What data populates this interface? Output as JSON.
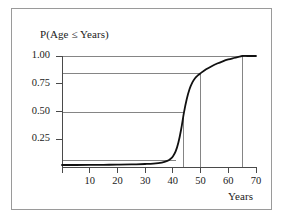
{
  "chart_data": {
    "type": "line",
    "title": "P(Age ≤ Years)",
    "xlabel": "Years",
    "ylabel": "",
    "xlim": [
      0,
      70
    ],
    "ylim": [
      0,
      1.0
    ],
    "grid": false,
    "legend": null,
    "xticks": [
      10,
      20,
      30,
      40,
      50,
      60,
      70
    ],
    "xtick_labels": [
      "10",
      "20",
      "30",
      "40",
      "50",
      "60",
      "70"
    ],
    "yticks": [
      0.25,
      0.5,
      0.75,
      1.0
    ],
    "ytick_labels": [
      "0.25",
      "0.50",
      "0.75",
      "1.00"
    ],
    "series": [
      {
        "name": "Cumulative probability",
        "color": "#111111",
        "x": [
          0,
          5,
          10,
          15,
          20,
          25,
          30,
          33,
          36,
          38,
          39,
          40,
          41,
          42,
          43,
          44,
          45,
          46,
          47,
          48,
          49,
          50,
          52,
          54,
          56,
          58,
          60,
          62,
          64,
          65,
          67,
          70
        ],
        "y": [
          0.018,
          0.018,
          0.019,
          0.02,
          0.021,
          0.023,
          0.027,
          0.031,
          0.04,
          0.055,
          0.07,
          0.095,
          0.14,
          0.22,
          0.34,
          0.49,
          0.61,
          0.7,
          0.76,
          0.8,
          0.825,
          0.845,
          0.88,
          0.908,
          0.932,
          0.952,
          0.969,
          0.982,
          0.994,
          1.0,
          1.0,
          1.0
        ]
      }
    ],
    "reference_lines": {
      "color": "#666666",
      "horizontal": [
        {
          "y": 1.0,
          "label": "1.00",
          "x_end": 70
        },
        {
          "y": 0.845,
          "label": "0.845",
          "x_end": 50
        },
        {
          "y": 0.49,
          "label": "0.50",
          "x_end": 44
        },
        {
          "y": 0.062,
          "label": "0.06",
          "x_end": 41
        }
      ],
      "vertical": [
        {
          "x": 44,
          "label": "44",
          "y_end": 0.49
        },
        {
          "x": 50,
          "label": "50",
          "y_end": 0.845
        },
        {
          "x": 65,
          "label": "65",
          "y_end": 1.0
        }
      ]
    },
    "annotations": []
  }
}
